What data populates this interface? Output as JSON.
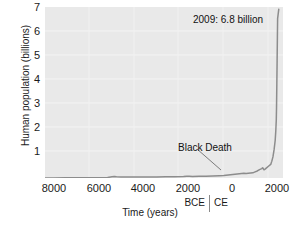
{
  "chart_data": {
    "type": "line",
    "title": "",
    "xlabel": "Time (years)",
    "ylabel": "Human population (billions)",
    "xlim": [
      -8400,
      2250
    ],
    "ylim": [
      0,
      7.3
    ],
    "grid": true,
    "legend": "none",
    "axis": {
      "y_ticks": [
        {
          "value": 7,
          "label": "7"
        },
        {
          "value": 6,
          "label": "6"
        },
        {
          "value": 5,
          "label": "5"
        },
        {
          "value": 4,
          "label": "4"
        },
        {
          "value": 3,
          "label": "3"
        },
        {
          "value": 2,
          "label": "2"
        },
        {
          "value": 1,
          "label": "1"
        }
      ],
      "x_ticks": [
        {
          "value": -8000,
          "label": "8000"
        },
        {
          "value": -6000,
          "label": "6000"
        },
        {
          "value": -4000,
          "label": "4000"
        },
        {
          "value": -2000,
          "label": "2000"
        },
        {
          "value": 0,
          "label": "0"
        },
        {
          "value": 2000,
          "label": "2000"
        }
      ],
      "era_left": "BCE",
      "era_right": "CE"
    },
    "series": [
      {
        "name": "Human population",
        "color": "#8c8c8c",
        "x": [
          -8400,
          -8000,
          -7500,
          -7000,
          -6500,
          -6000,
          -5600,
          -5400,
          -5300,
          -5200,
          -5000,
          -4600,
          -4200,
          -3800,
          -3400,
          -3000,
          -2600,
          -2200,
          -2050,
          -1950,
          -1800,
          -1500,
          -1200,
          -900,
          -600,
          -400,
          -200,
          0,
          200,
          400,
          500,
          600,
          700,
          800,
          900,
          1000,
          1100,
          1200,
          1300,
          1340,
          1400,
          1450,
          1500,
          1600,
          1700,
          1750,
          1800,
          1850,
          1900,
          1927,
          1950,
          1960,
          1974,
          1987,
          1999,
          2009,
          2060
        ],
        "y": [
          0.005,
          0.005,
          0.006,
          0.007,
          0.008,
          0.01,
          0.02,
          0.055,
          0.065,
          0.055,
          0.04,
          0.04,
          0.042,
          0.045,
          0.048,
          0.05,
          0.055,
          0.06,
          0.072,
          0.07,
          0.068,
          0.075,
          0.08,
          0.09,
          0.1,
          0.11,
          0.13,
          0.15,
          0.17,
          0.19,
          0.2,
          0.19,
          0.2,
          0.21,
          0.22,
          0.26,
          0.3,
          0.36,
          0.4,
          0.44,
          0.35,
          0.38,
          0.42,
          0.5,
          0.58,
          0.72,
          0.9,
          1.2,
          1.6,
          2.0,
          2.5,
          3.0,
          4.0,
          5.0,
          6.0,
          6.8,
          7.2
        ]
      }
    ],
    "annotations": [
      {
        "id": "peak",
        "text": "2009: 6.8 billion",
        "x": 2009,
        "y": 6.8
      },
      {
        "id": "black-death",
        "text": "Black Death",
        "x": 1340,
        "y": 0.44
      }
    ]
  }
}
